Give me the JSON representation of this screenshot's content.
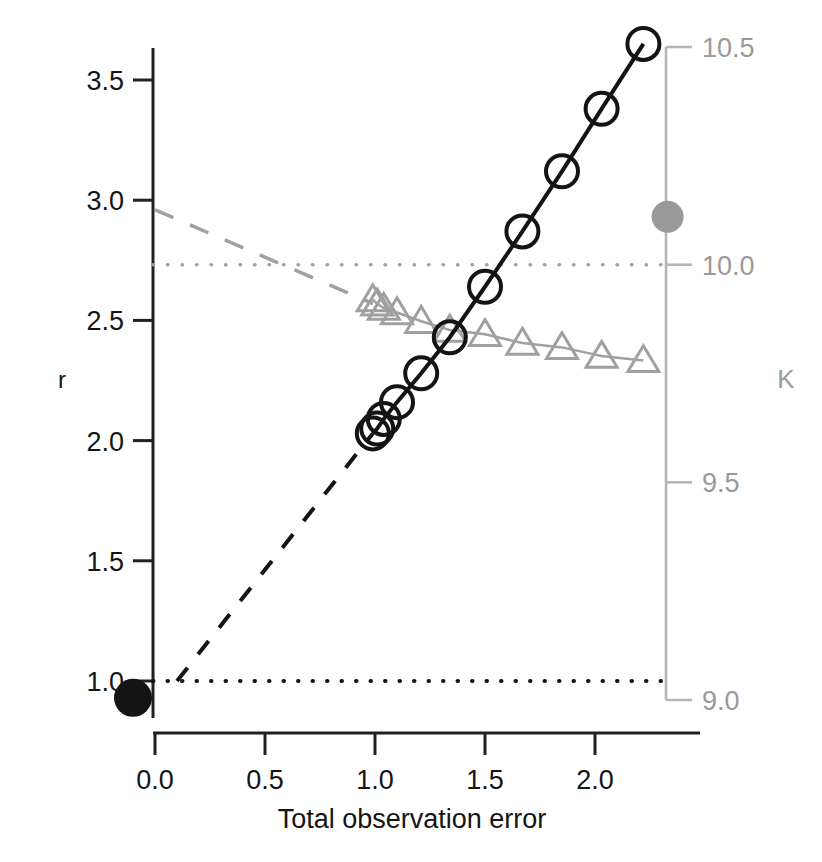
{
  "chart_data": {
    "type": "line",
    "title": "",
    "subtitle": "",
    "xlabel": "Total observation error",
    "ylabel": "r",
    "y2label": "K",
    "xlim": [
      -0.18,
      2.45
    ],
    "ylim": [
      0.78,
      3.78
    ],
    "y2lim": [
      8.97,
      10.55
    ],
    "grid": false,
    "legend": null,
    "xticks": [
      "0.0",
      "0.5",
      "1.0",
      "1.5",
      "2.0"
    ],
    "xtick_values": [
      0.0,
      0.5,
      1.0,
      1.5,
      2.0
    ],
    "yticks": [
      "1.0",
      "1.5",
      "2.0",
      "2.5",
      "3.0",
      "3.5"
    ],
    "ytick_values": [
      1.0,
      1.5,
      2.0,
      2.5,
      3.0,
      3.5
    ],
    "y2ticks": [
      "9.0",
      "9.5",
      "10.0",
      "10.5"
    ],
    "y2tick_values": [
      9.0,
      9.5,
      10.0,
      10.5
    ],
    "series": [
      {
        "name": "r estimates",
        "marker": "open-circle",
        "color": "#141414",
        "axis": "left",
        "x": [
          0.99,
          1.01,
          1.04,
          1.1,
          1.21,
          1.34,
          1.5,
          1.67,
          1.85,
          2.03,
          2.22
        ],
        "values": [
          2.03,
          2.05,
          2.09,
          2.16,
          2.28,
          2.43,
          2.64,
          2.87,
          3.12,
          3.38,
          3.65
        ]
      },
      {
        "name": "K estimates",
        "marker": "open-triangle",
        "color": "#a0a0a0",
        "axis": "right",
        "x": [
          0.99,
          1.01,
          1.04,
          1.1,
          1.21,
          1.34,
          1.5,
          1.67,
          1.85,
          2.03,
          2.22
        ],
        "values": [
          9.92,
          9.91,
          9.9,
          9.89,
          9.87,
          9.85,
          9.84,
          9.82,
          9.81,
          9.79,
          9.78
        ],
        "values_on_left_scale": [
          2.57,
          2.555,
          2.545,
          2.525,
          2.5,
          2.455,
          2.44,
          2.405,
          2.38,
          2.345,
          2.32
        ]
      }
    ],
    "extrapolation_lines": [
      {
        "name": "r extrapolation",
        "style": "dashed",
        "color": "#141414",
        "axis": "left",
        "x": [
          0.1,
          0.99
        ],
        "values": [
          1.0,
          2.03
        ]
      },
      {
        "name": "K extrapolation",
        "style": "dashed",
        "color": "#a0a0a0",
        "axis": "left-scale",
        "x": [
          0.0,
          0.99
        ],
        "values": [
          2.96,
          2.57
        ]
      }
    ],
    "reference_lines": [
      {
        "name": "r true value",
        "style": "dotted",
        "color": "#141414",
        "axis": "left",
        "value": 1.0
      },
      {
        "name": "K true value",
        "style": "dotted",
        "color": "#a0a0a0",
        "axis": "right",
        "value": 10.0,
        "value_on_left_scale": 2.735
      }
    ],
    "points": [
      {
        "name": "r true point",
        "marker": "filled-circle",
        "color": "#141414",
        "axis": "left",
        "x": -0.1,
        "value": 0.93
      },
      {
        "name": "K true point",
        "marker": "filled-circle",
        "color": "#9a9a9a",
        "axis": "right",
        "x": 2.33,
        "value": 10.11,
        "value_on_left_scale": 2.96
      }
    ]
  }
}
